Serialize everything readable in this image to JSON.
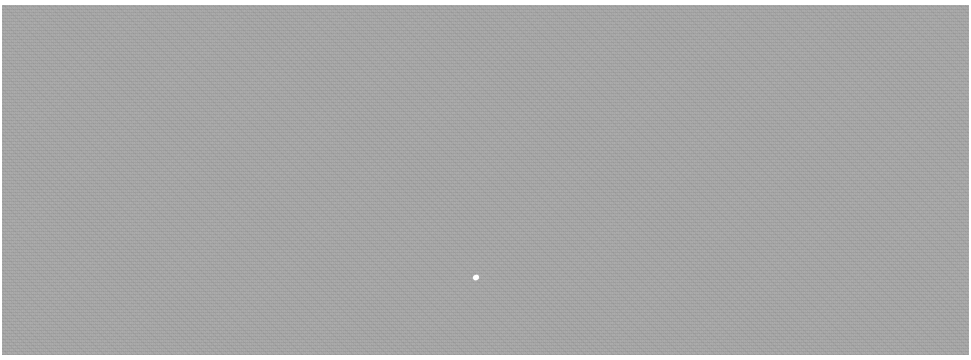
{
  "image": {
    "description": "Uniform gray grainy textured field with a single small white speck",
    "colors": {
      "field": "#a6a6a6",
      "border": "#ffffff",
      "speck": "#ffffff"
    },
    "speck": {
      "x": 473,
      "y": 275
    }
  }
}
